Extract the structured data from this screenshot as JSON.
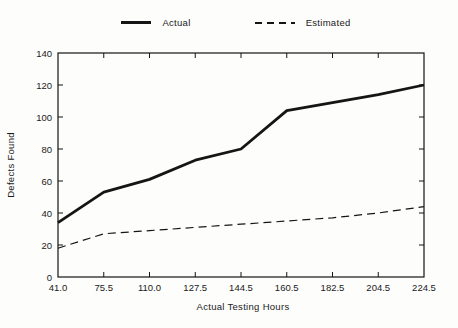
{
  "page": {
    "background": "#fdfdfc",
    "ink": "#1a1a1a"
  },
  "legend": {
    "items": [
      {
        "label": "Actual",
        "style": "solid"
      },
      {
        "label": "Estimated",
        "style": "dashed"
      }
    ]
  },
  "chart_data": {
    "type": "line",
    "title": "",
    "xlabel": "Actual Testing Hours",
    "ylabel": "Defects Found",
    "categories": [
      "41.0",
      "75.5",
      "110.0",
      "127.5",
      "144.5",
      "160.5",
      "182.5",
      "204.5",
      "224.5"
    ],
    "series": [
      {
        "name": "Actual",
        "style": "solid",
        "values": [
          34,
          53,
          61,
          73,
          80,
          104,
          109,
          114,
          120
        ]
      },
      {
        "name": "Estimated",
        "style": "dashed",
        "values": [
          18,
          27,
          29,
          31,
          33,
          35,
          37,
          40,
          44
        ]
      }
    ],
    "ylim": [
      0,
      140
    ],
    "yticks": [
      0,
      20,
      40,
      60,
      80,
      100,
      120,
      140
    ],
    "grid": false,
    "frame": "box-with-mirrored-ticks",
    "legend_position": "top-center",
    "line_color": "#151515"
  }
}
